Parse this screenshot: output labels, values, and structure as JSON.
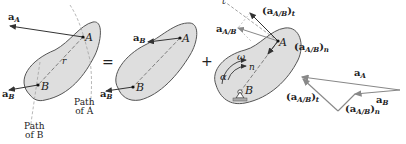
{
  "diagram": {
    "operators": {
      "equals": "=",
      "plus": "+"
    },
    "panel1": {
      "point_a": "A",
      "point_b": "B",
      "radius": "r",
      "accel_a": {
        "main": "a",
        "sub": "A"
      },
      "accel_b": {
        "main": "a",
        "sub": "B"
      },
      "path_a": [
        "Path",
        "of A"
      ],
      "path_b": [
        "Path",
        "of B"
      ]
    },
    "panel2": {
      "point_a": "A",
      "point_b": "B",
      "accel_b_at_a": {
        "main": "a",
        "sub": "B"
      },
      "accel_b_at_b": {
        "main": "a",
        "sub": "B"
      }
    },
    "panel3": {
      "point_a": "A",
      "point_b": "B",
      "t_axis": "t",
      "n_axis": "n",
      "omega": "ω",
      "alpha": "α",
      "a_rel": {
        "main": "a",
        "sub": "A/B"
      },
      "a_rel_t": {
        "open": "(",
        "main": "a",
        "sub": "A/B",
        "close": ")",
        "sub2": "t"
      },
      "a_rel_n": {
        "open": "(",
        "main": "a",
        "sub": "A/B",
        "close": ")",
        "sub2": "n"
      }
    },
    "vector_polygon": {
      "a_A": {
        "main": "a",
        "sub": "A"
      },
      "a_B": {
        "main": "a",
        "sub": "B"
      },
      "a_rel_t": {
        "open": "(",
        "main": "a",
        "sub": "A/B",
        "close": ")",
        "sub2": "t"
      },
      "a_rel_n": {
        "open": "(",
        "main": "a",
        "sub": "A/B",
        "close": ")",
        "sub2": "n"
      }
    },
    "colors": {
      "body_fill": "#dedede",
      "outline": "#555555",
      "vector": "#333333",
      "gray_vector": "#8a8a8a",
      "path": "#999999"
    }
  }
}
